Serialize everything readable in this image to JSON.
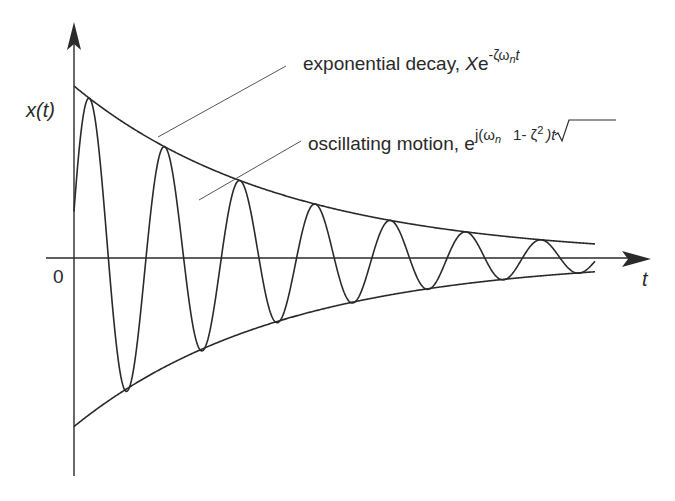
{
  "diagram": {
    "type": "damped-oscillation",
    "colors": {
      "ink": "#2a2a2a",
      "leader": "#555555",
      "background": "#ffffff"
    },
    "axes": {
      "y_label": "x(t)",
      "x_label": "t",
      "origin_label": "0"
    },
    "annotations": {
      "decay_text": "exponential decay, ",
      "decay_symbol_base": "X",
      "decay_symbol_e": "e",
      "decay_exponent": "-ζω",
      "decay_exponent_sub": "n",
      "decay_exponent_tail": "t",
      "osc_text": "oscillating motion, ",
      "osc_e": "e",
      "osc_exp_head": "j(ω",
      "osc_exp_sub": "n",
      "osc_sqrt_content": "1- ζ",
      "osc_sqrt_power": "2",
      "osc_exp_tail": ")t"
    }
  },
  "chart_data": {
    "type": "line",
    "title": "",
    "xlabel": "t",
    "ylabel": "x(t)",
    "model": {
      "amplitude_X": 1.0,
      "decay_rate_zeta_omega_n": 0.362,
      "damped_period": 1.0,
      "initial_value": 0.27,
      "lower_envelope_scale": 0.98
    },
    "xlim": [
      0,
      6.92
    ],
    "ylim": [
      -1.1,
      1.2
    ],
    "peaks": [
      {
        "t": 0.4,
        "x": 0.86
      },
      {
        "t": 1.45,
        "x": 0.6
      },
      {
        "t": 2.47,
        "x": 0.42
      },
      {
        "t": 3.49,
        "x": 0.3
      },
      {
        "t": 4.48,
        "x": 0.2
      },
      {
        "t": 5.46,
        "x": 0.13
      },
      {
        "t": 6.4,
        "x": 0.08
      }
    ],
    "troughs": [
      {
        "t": 0.93,
        "x": -0.71
      },
      {
        "t": 1.96,
        "x": -0.5
      },
      {
        "t": 3.0,
        "x": -0.34
      },
      {
        "t": 3.98,
        "x": -0.24
      },
      {
        "t": 4.97,
        "x": -0.16
      },
      {
        "t": 5.9,
        "x": -0.1
      },
      {
        "t": 6.83,
        "x": -0.07
      }
    ],
    "series": [
      {
        "name": "upper envelope",
        "expr": "X e^{-ζω_n t}"
      },
      {
        "name": "lower envelope",
        "expr": "-X e^{-ζω_n t}"
      },
      {
        "name": "oscillating motion",
        "expr": "X e^{-ζω_n t} cos(2π t + φ)"
      }
    ],
    "grid": false,
    "legend": "none (leader-line annotations top-right)"
  }
}
